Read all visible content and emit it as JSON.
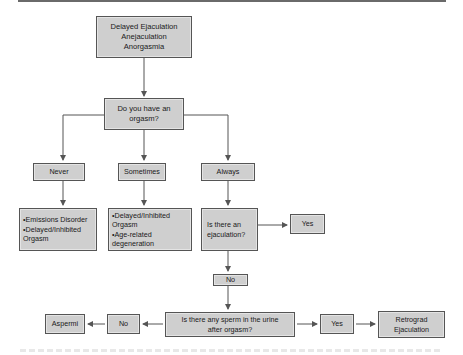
{
  "diagram": {
    "type": "flowchart",
    "colors": {
      "box_fill": "#cfcfcf",
      "box_border": "#555555",
      "line": "#555555",
      "background": "#ffffff"
    },
    "nodes": {
      "start": {
        "lines": [
          "Delayed Ejaculation",
          "Anejaculation",
          "Anorgasmia"
        ]
      },
      "q_orgasm": {
        "lines": [
          "Do you have an",
          "orgasm?"
        ]
      },
      "never": {
        "label": "Never"
      },
      "sometimes": {
        "label": "Sometimes"
      },
      "always": {
        "label": "Always"
      },
      "never_result": {
        "lines": [
          "•Emissions Disorder",
          "•Delayed/Inhibited",
          "Orgasm"
        ]
      },
      "sometimes_result": {
        "lines": [
          "•Delayed/Inhibited",
          "Orgasm",
          "•Age-related",
          "degeneration"
        ]
      },
      "q_ejaculation": {
        "lines": [
          "Is there an",
          "ejaculation?"
        ]
      },
      "ejac_yes": {
        "label": "Yes"
      },
      "ejac_no": {
        "label": "No"
      },
      "q_sperm": {
        "lines": [
          "Is there any sperm in the urine",
          "after orgasm?"
        ]
      },
      "sperm_no": {
        "label": "No"
      },
      "aspermia": {
        "label": "Aspermi"
      },
      "sperm_yes": {
        "label": "Yes"
      },
      "retrograde": {
        "lines": [
          "Retrograd",
          "Ejaculation"
        ]
      }
    },
    "edges": [
      [
        "start",
        "q_orgasm"
      ],
      [
        "q_orgasm",
        "never"
      ],
      [
        "q_orgasm",
        "sometimes"
      ],
      [
        "q_orgasm",
        "always"
      ],
      [
        "never",
        "never_result"
      ],
      [
        "sometimes",
        "sometimes_result"
      ],
      [
        "always",
        "q_ejaculation"
      ],
      [
        "q_ejaculation",
        "ejac_yes"
      ],
      [
        "q_ejaculation",
        "ejac_no"
      ],
      [
        "ejac_no",
        "q_sperm"
      ],
      [
        "q_sperm",
        "sperm_no"
      ],
      [
        "sperm_no",
        "aspermia"
      ],
      [
        "q_sperm",
        "sperm_yes"
      ],
      [
        "sperm_yes",
        "retrograde"
      ]
    ]
  }
}
